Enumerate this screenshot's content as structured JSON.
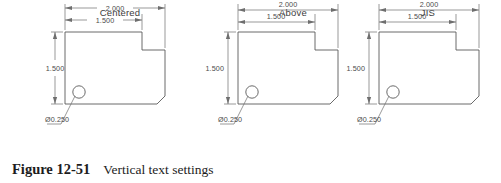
{
  "figure": {
    "label": "Figure 12-51",
    "text": "Vertical text settings"
  },
  "colors": {
    "geometry_line": "#5a5a5a",
    "dimension_line": "#6e6e6e",
    "text": "#4a4a4a",
    "title_text": "#3c3c3c",
    "caption_text": "#1c1c1c",
    "background": "#ffffff"
  },
  "panels": [
    {
      "title": "Centered",
      "style": "centered",
      "dimensions": {
        "overall_width": "2.000",
        "inner_width": "1.500",
        "height": "1.500",
        "hole": "Ø0.250"
      }
    },
    {
      "title": "Above",
      "style": "above",
      "dimensions": {
        "overall_width": "2.000",
        "inner_width": "1.500",
        "height": "1.500",
        "hole": "Ø0.250"
      }
    },
    {
      "title": "JIS",
      "style": "jis",
      "dimensions": {
        "overall_width": "2.000",
        "inner_width": "1.500",
        "height": "1.500",
        "hole": "Ø0.250"
      }
    }
  ]
}
